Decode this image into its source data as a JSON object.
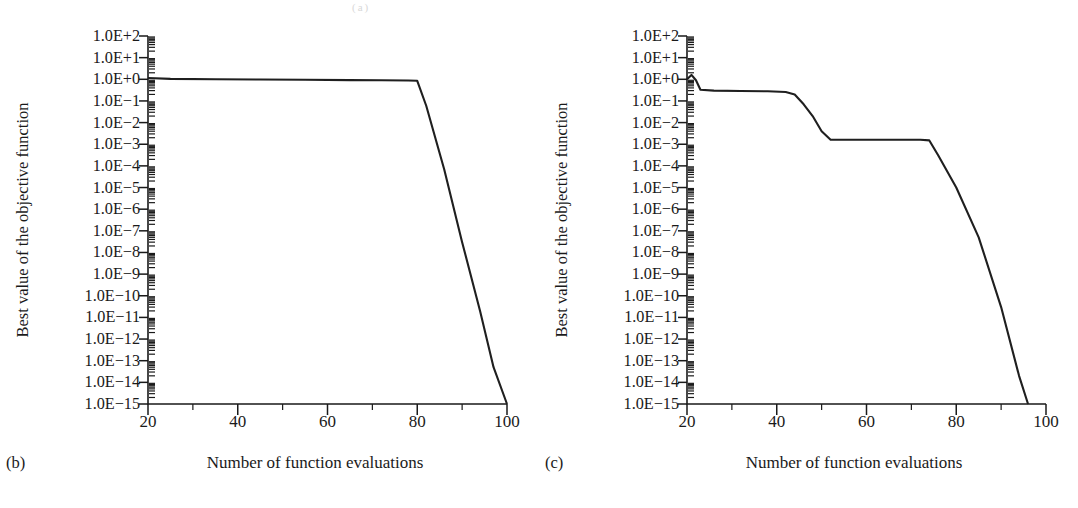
{
  "figure": {
    "background": "#ffffff",
    "line_color": "#1f1f1f",
    "axis_color": "#1a1a1a",
    "top_artifact": "(a)"
  },
  "panels": [
    {
      "letter": "(b)",
      "xlabel": "Number of function evaluations",
      "ylabel": "Best value of the objective function"
    },
    {
      "letter": "(c)",
      "xlabel": "Number of function evaluations",
      "ylabel": "Best value of the objective function"
    }
  ],
  "axis": {
    "y_tick_labels": [
      "1.0E+2",
      "1.0E+1",
      "1.0E+0",
      "1.0E-1",
      "1.0E-2",
      "1.0E-3",
      "1.0E-4",
      "1.0E-5",
      "1.0E-6",
      "1.0E-7",
      "1.0E-8",
      "1.0E-9",
      "1.0E-10",
      "1.0E-11",
      "1.0E-12",
      "1.0E-13",
      "1.0E-14",
      "1.0E-15"
    ],
    "y_tick_exponents": [
      2,
      1,
      0,
      -1,
      -2,
      -3,
      -4,
      -5,
      -6,
      -7,
      -8,
      -9,
      -10,
      -11,
      -12,
      -13,
      -14,
      -15
    ],
    "x_tick_labels": [
      "20",
      "40",
      "60",
      "80",
      "100"
    ],
    "x_tick_values": [
      20,
      40,
      60,
      80,
      100
    ],
    "x_minor_values": [
      30,
      50,
      70,
      90
    ]
  },
  "chart_data": [
    {
      "type": "line",
      "title": "",
      "panel": "(b)",
      "xlabel": "Number of function evaluations",
      "ylabel": "Best value of the objective function",
      "yscale": "log",
      "xlim": [
        20,
        100
      ],
      "ylim": [
        1e-15,
        100
      ],
      "grid": false,
      "legend": null,
      "series": [
        {
          "name": "best objective value",
          "x": [
            20,
            25,
            35,
            45,
            55,
            65,
            72,
            78,
            80,
            82,
            86,
            90,
            94,
            97,
            100
          ],
          "y": [
            1.15,
            1.05,
            1.0,
            0.98,
            0.95,
            0.92,
            0.9,
            0.88,
            0.85,
            0.06,
            7e-05,
            3e-08,
            2e-11,
            5e-14,
            1e-15
          ]
        }
      ]
    },
    {
      "type": "line",
      "title": "",
      "panel": "(c)",
      "xlabel": "Number of function evaluations",
      "ylabel": "Best value of the objective function",
      "yscale": "log",
      "xlim": [
        20,
        100
      ],
      "ylim": [
        1e-15,
        100
      ],
      "grid": false,
      "legend": null,
      "series": [
        {
          "name": "best objective value",
          "x": [
            20,
            21,
            22,
            23,
            26,
            32,
            38,
            42,
            44,
            46,
            48,
            50,
            52,
            58,
            66,
            72,
            74,
            76,
            80,
            85,
            90,
            94,
            96
          ],
          "y": [
            1.0,
            1.6,
            0.9,
            0.33,
            0.3,
            0.29,
            0.28,
            0.26,
            0.2,
            0.07,
            0.02,
            0.004,
            0.0016,
            0.0016,
            0.0016,
            0.0016,
            0.0015,
            0.0003,
            1e-05,
            5e-08,
            3e-11,
            2e-14,
            1e-15
          ]
        }
      ]
    }
  ]
}
